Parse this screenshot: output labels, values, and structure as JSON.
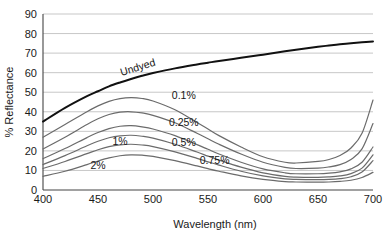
{
  "chart_data": {
    "type": "line",
    "title": "",
    "xlabel": "Wavelength (nm)",
    "ylabel": "% Reflectance",
    "xlim": [
      400,
      700
    ],
    "ylim": [
      0,
      90
    ],
    "xticks": [
      400,
      450,
      500,
      550,
      600,
      650,
      700
    ],
    "xtick_labels": [
      "400",
      "450",
      "500",
      "550",
      "600",
      "650",
      "700"
    ],
    "yticks": [
      0,
      10,
      20,
      30,
      40,
      50,
      60,
      70,
      80,
      90
    ],
    "ytick_labels": [
      "0",
      "10",
      "20",
      "30",
      "40",
      "50",
      "60",
      "70",
      "80",
      "90"
    ],
    "grid": "horizontal",
    "legend": "inline-annotations",
    "x": [
      400,
      420,
      440,
      450,
      460,
      470,
      480,
      490,
      500,
      520,
      540,
      550,
      560,
      580,
      600,
      620,
      630,
      650,
      660,
      670,
      680,
      690,
      700
    ],
    "series": [
      {
        "name": "Undyed",
        "label": "Undyed",
        "emphasis": true,
        "color": "#111111",
        "label_x": 487,
        "label_y": 61,
        "label_rotate": -17,
        "values": [
          35.0,
          42.0,
          48.0,
          50.5,
          53.0,
          55.0,
          56.8,
          58.4,
          59.8,
          62.2,
          64.2,
          65.1,
          66.0,
          67.6,
          69.2,
          70.9,
          71.7,
          73.2,
          73.9,
          74.5,
          75.0,
          75.5,
          76.0
        ]
      },
      {
        "name": "0.1%",
        "label": "0.1%",
        "emphasis": false,
        "color": "#6b6b6b",
        "label_x": 528,
        "label_y": 46.5,
        "label_rotate": 0,
        "values": [
          27.0,
          33.5,
          40.0,
          43.0,
          45.3,
          46.7,
          47.2,
          46.8,
          45.5,
          41.0,
          34.5,
          31.2,
          27.8,
          22.0,
          17.0,
          14.2,
          13.8,
          14.6,
          15.6,
          17.6,
          21.5,
          29.0,
          46.0
        ]
      },
      {
        "name": "0.25%",
        "label": "0.25%",
        "emphasis": false,
        "color": "#6b6b6b",
        "label_x": 528,
        "label_y": 32.5,
        "label_rotate": 0,
        "values": [
          21.0,
          27.0,
          33.5,
          36.4,
          38.6,
          39.8,
          40.0,
          39.4,
          38.2,
          34.4,
          29.0,
          26.2,
          23.4,
          18.4,
          14.2,
          11.6,
          11.0,
          11.2,
          11.8,
          13.0,
          15.6,
          21.0,
          34.0
        ]
      },
      {
        "name": "0.5%",
        "label": "0.5%",
        "emphasis": false,
        "color": "#6b6b6b",
        "label_x": 528,
        "label_y": 22.5,
        "label_rotate": 0,
        "values": [
          16.0,
          21.2,
          26.8,
          29.4,
          31.4,
          32.6,
          32.9,
          32.3,
          31.2,
          27.8,
          23.2,
          20.8,
          18.4,
          14.2,
          10.8,
          8.8,
          8.3,
          8.3,
          8.6,
          9.3,
          10.8,
          14.2,
          22.0
        ]
      },
      {
        "name": "0.75%",
        "label": "0.75%",
        "emphasis": false,
        "color": "#6b6b6b",
        "label_x": 556,
        "label_y": 13.5,
        "label_rotate": 0,
        "values": [
          13.0,
          17.6,
          22.6,
          24.9,
          26.7,
          27.7,
          28.0,
          27.5,
          26.5,
          23.4,
          19.4,
          17.3,
          15.3,
          11.7,
          8.8,
          7.0,
          6.6,
          6.5,
          6.7,
          7.2,
          8.4,
          11.2,
          18.0
        ]
      },
      {
        "name": "1%",
        "label": "1%",
        "emphasis": false,
        "color": "#6b6b6b",
        "label_x": 470,
        "label_y": 23.0,
        "label_rotate": 0,
        "values": [
          11.0,
          14.6,
          18.6,
          20.6,
          22.2,
          23.1,
          23.4,
          23.0,
          22.2,
          19.5,
          16.2,
          14.4,
          12.7,
          9.6,
          7.2,
          5.7,
          5.4,
          5.3,
          5.4,
          5.8,
          6.8,
          9.2,
          15.0
        ]
      },
      {
        "name": "2%",
        "label": "2%",
        "emphasis": false,
        "color": "#6b6b6b",
        "label_x": 450,
        "label_y": 10.5,
        "label_rotate": 0,
        "values": [
          7.0,
          9.6,
          13.0,
          14.8,
          16.4,
          17.5,
          18.0,
          17.8,
          17.2,
          15.0,
          12.3,
          10.9,
          9.6,
          7.2,
          5.4,
          4.3,
          4.1,
          4.0,
          4.1,
          4.4,
          5.0,
          6.4,
          9.0
        ]
      }
    ]
  }
}
